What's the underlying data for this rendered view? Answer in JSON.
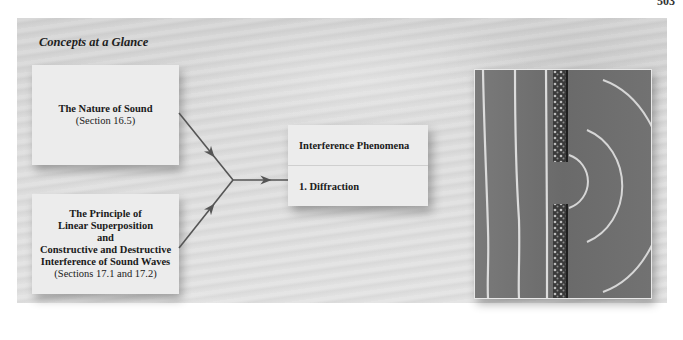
{
  "page": {
    "page_number": "503"
  },
  "panel": {
    "title": "Concepts at a Glance"
  },
  "concepts": [
    {
      "heading_lines": [
        "The Nature of Sound"
      ],
      "reference": "(Section 16.5)"
    },
    {
      "heading_lines": [
        "The Principle of",
        "Linear Superposition",
        "and",
        "Constructive and Destructive",
        "Interference of Sound Waves"
      ],
      "reference": "(Sections 17.1 and 17.2)"
    }
  ],
  "result": {
    "title": "Interference Phenomena",
    "items": [
      "1. Diffraction"
    ]
  },
  "figure": {
    "colors": {
      "water": "#6e6e6e",
      "crest": "#d8d8d8",
      "barrier": "#2e2e2e"
    }
  },
  "colors": {
    "panel_bg": "#dadada",
    "box_bg": "#ececec",
    "arrow": "#555555"
  }
}
